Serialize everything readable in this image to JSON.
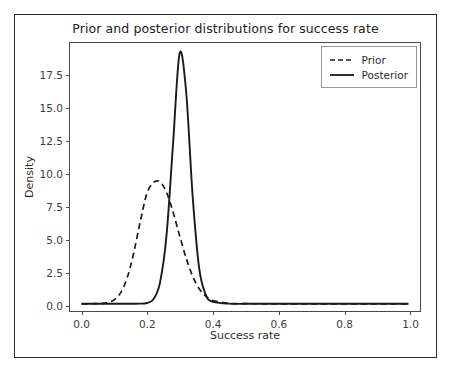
{
  "figure": {
    "title": "Prior and posterior distributions for success rate",
    "background_color": "#ffffff",
    "frame_color": "#2b2b2b",
    "axis_color": "#4a4a4a",
    "line_color": "#1a1a1a"
  },
  "axes": {
    "xlabel": "Success rate",
    "ylabel": "Density",
    "xticks": [
      "0.0",
      "0.2",
      "0.4",
      "0.6",
      "0.8",
      "1.0"
    ],
    "xtick_values": [
      0.0,
      0.2,
      0.4,
      0.6,
      0.8,
      1.0
    ],
    "yticks": [
      "0.0",
      "2.5",
      "5.0",
      "7.5",
      "10.0",
      "12.5",
      "15.0",
      "17.5"
    ],
    "ytick_values": [
      0.0,
      2.5,
      5.0,
      7.5,
      10.0,
      12.5,
      15.0,
      17.5
    ]
  },
  "legend": {
    "position": "upper right",
    "entries": [
      {
        "label": "Prior",
        "style": "dashed"
      },
      {
        "label": "Posterior",
        "style": "solid"
      }
    ]
  },
  "chart_data": {
    "type": "line",
    "title": "Prior and posterior distributions for success rate",
    "xlabel": "Success rate",
    "ylabel": "Density",
    "xlim": [
      -0.035,
      1.035
    ],
    "ylim": [
      -0.55,
      19.9
    ],
    "grid": false,
    "legend_position": "upper right",
    "x": [
      0.0,
      0.02,
      0.04,
      0.06,
      0.08,
      0.1,
      0.12,
      0.14,
      0.16,
      0.18,
      0.2,
      0.22,
      0.24,
      0.26,
      0.28,
      0.3,
      0.32,
      0.34,
      0.36,
      0.38,
      0.4,
      0.45,
      0.5,
      0.55,
      0.6,
      0.65,
      0.7,
      0.75,
      0.8,
      0.85,
      0.9,
      0.95,
      1.0
    ],
    "series": [
      {
        "name": "Prior",
        "style": "dashed",
        "color": "#1a1a1a",
        "peak_x": 0.24,
        "peak_y": 9.3,
        "values": [
          0.0,
          0.0,
          0.01,
          0.03,
          0.1,
          0.3,
          0.85,
          2.0,
          3.9,
          6.3,
          8.4,
          9.25,
          9.3,
          8.5,
          7.0,
          5.2,
          3.5,
          2.1,
          1.15,
          0.58,
          0.26,
          0.04,
          0.01,
          0.0,
          0.0,
          0.0,
          0.0,
          0.0,
          0.0,
          0.0,
          0.0,
          0.0,
          0.0
        ]
      },
      {
        "name": "Posterior",
        "style": "solid",
        "color": "#1a1a1a",
        "peak_x": 0.3,
        "peak_y": 19.1,
        "values": [
          0.0,
          0.0,
          0.0,
          0.0,
          0.0,
          0.0,
          0.0,
          0.0,
          0.0,
          0.01,
          0.06,
          0.35,
          1.6,
          5.2,
          12.2,
          19.1,
          16.2,
          8.2,
          2.7,
          0.7,
          0.16,
          0.01,
          0.0,
          0.0,
          0.0,
          0.0,
          0.0,
          0.0,
          0.0,
          0.0,
          0.0,
          0.0,
          0.0
        ]
      }
    ]
  }
}
